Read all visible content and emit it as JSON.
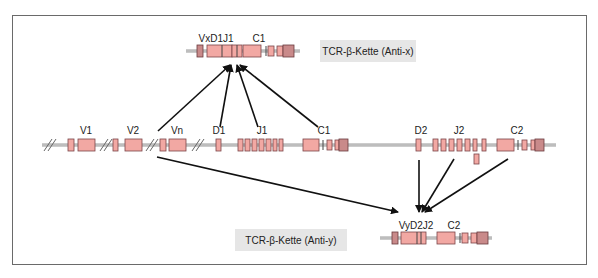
{
  "diagram": {
    "title_boxes": {
      "anti_x": "TCR-β-Kette (Anti-x)",
      "anti_y": "TCR-β-Kette (Anti-y)"
    },
    "top_gene": {
      "labels": {
        "vdj": "VxD1J1",
        "c": "C1"
      }
    },
    "germline": {
      "labels": {
        "v1": "V1",
        "v2": "V2",
        "vn": "Vn",
        "d1": "D1",
        "j1": "J1",
        "c1": "C1",
        "d2": "D2",
        "j2": "J2",
        "c2": "C2"
      }
    },
    "bottom_gene": {
      "labels": {
        "vdj": "VyD2J2",
        "c": "C2"
      }
    },
    "colors": {
      "exon": "#f2a8a3",
      "exon_dark": "#c98a8a",
      "label_box": "#e6e6e6",
      "arrow": "#111111"
    },
    "arrows": [
      {
        "from": "Vn",
        "to": "VxD1J1"
      },
      {
        "from": "D1",
        "to": "VxD1J1"
      },
      {
        "from": "J1",
        "to": "VxD1J1"
      },
      {
        "from": "C1",
        "to": "VxD1J1"
      },
      {
        "from": "Vn",
        "to": "VyD2J2"
      },
      {
        "from": "D2",
        "to": "VyD2J2"
      },
      {
        "from": "J2",
        "to": "VyD2J2"
      },
      {
        "from": "C2",
        "to": "VyD2J2"
      }
    ]
  }
}
